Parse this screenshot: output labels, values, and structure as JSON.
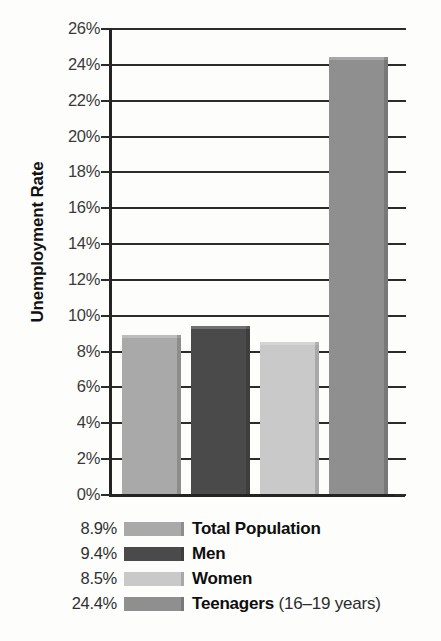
{
  "chart_data": {
    "type": "bar",
    "title": "",
    "xlabel": "",
    "ylabel": "Unemployment Rate",
    "categories": [
      "Total Population",
      "Men",
      "Women",
      "Teenagers"
    ],
    "values": [
      8.9,
      9.4,
      8.5,
      24.4
    ],
    "value_labels": [
      "8.9%",
      "9.4%",
      "8.5%",
      "24.4%"
    ],
    "ylim": [
      0,
      26
    ],
    "ytick_step": 2,
    "grid": true,
    "grid_axis": "y",
    "legend_position": "below",
    "bar_colors": [
      "#a9a9a9",
      "#4a4a4a",
      "#c9c9c9",
      "#8f8f8f"
    ],
    "ytick_labels": [
      "26%",
      "24%",
      "22%",
      "20%",
      "18%",
      "16%",
      "14%",
      "12%",
      "10%",
      "8%",
      "6%",
      "4%",
      "2%",
      "0%"
    ],
    "ytick_values": [
      26,
      24,
      22,
      20,
      18,
      16,
      14,
      12,
      10,
      8,
      6,
      4,
      2,
      0
    ]
  },
  "axis": {
    "y_title": "Unemployment Rate"
  },
  "legend": {
    "items": [
      {
        "value": "8.9%",
        "label": "Total Population",
        "sub": "",
        "color": "#a9a9a9"
      },
      {
        "value": "9.4%",
        "label": "Men",
        "sub": "",
        "color": "#4a4a4a"
      },
      {
        "value": "8.5%",
        "label": "Women",
        "sub": "",
        "color": "#c9c9c9"
      },
      {
        "value": "24.4%",
        "label": "Teenagers",
        "sub": "(16–19 years)",
        "color": "#8f8f8f"
      }
    ]
  }
}
